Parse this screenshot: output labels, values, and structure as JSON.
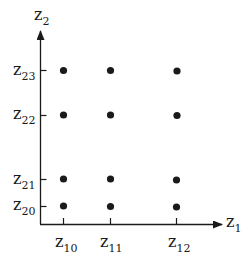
{
  "diagram": {
    "type": "grid-point-diagram",
    "axes": {
      "x": {
        "label_base": "z",
        "label_sub": "1"
      },
      "y": {
        "label_base": "z",
        "label_sub": "2"
      }
    },
    "x_ticks": [
      {
        "base": "z",
        "sub": "10"
      },
      {
        "base": "z",
        "sub": "11"
      },
      {
        "base": "z",
        "sub": "12"
      }
    ],
    "y_ticks": [
      {
        "base": "z",
        "sub": "20"
      },
      {
        "base": "z",
        "sub": "21"
      },
      {
        "base": "z",
        "sub": "22"
      },
      {
        "base": "z",
        "sub": "23"
      }
    ],
    "points_grid": "3 x 4 (every x tick × every y tick)",
    "colors": {
      "ink": "#1a1a1a",
      "background": "#ffffff"
    }
  }
}
